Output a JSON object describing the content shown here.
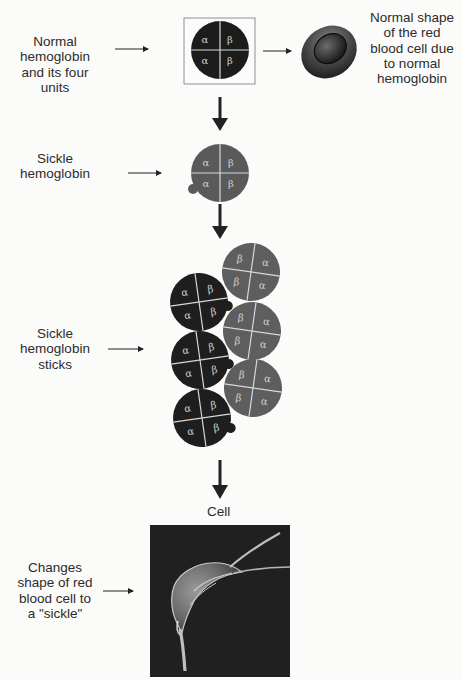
{
  "labels": {
    "normal_hemoglobin": [
      "Normal",
      "hemoglobin",
      "and its four",
      "units"
    ],
    "normal_cell": [
      "Normal shape",
      "of the red",
      "blood cell due",
      "to normal",
      "hemoglobin"
    ],
    "sickle_hemoglobin": [
      "Sickle",
      "hemoglobin"
    ],
    "sickle_sticks": [
      "Sickle",
      "hemoglobin",
      "sticks"
    ],
    "sickle_shape": [
      "Changes",
      "shape of red",
      "blood cell to",
      "a \"sickle\""
    ],
    "cell_caption": "Cell"
  },
  "subunits": {
    "alpha": "α",
    "beta": "β"
  },
  "colors": {
    "normal_hemoglobin": "#1c1c1c",
    "sickle_hemoglobin": "#5a5a5a",
    "stack_dark": "#1e1e1e",
    "stack_gray": "#5e5e5e",
    "divider": "#d8d8d8",
    "greek_text": "#cfcfcf",
    "arrow": "#222222"
  },
  "icons": {
    "arrow": "right-arrow",
    "down_arrow": "down-arrow",
    "rbc": "red-blood-cell",
    "sickle_photo": "sickle-cell-micrograph"
  }
}
